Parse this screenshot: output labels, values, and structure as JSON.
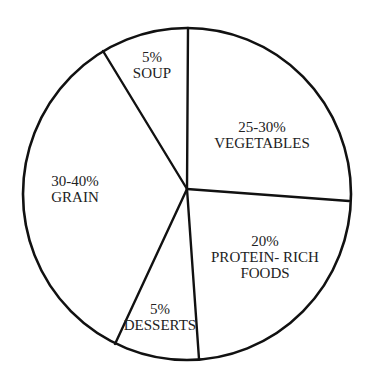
{
  "chart_data": {
    "type": "pie",
    "title": "",
    "style": {
      "stroke_color": "#111111",
      "fill_color": "#ffffff",
      "text_color": "#222222"
    },
    "geometry": {
      "hub": [
        187,
        189
      ],
      "ellipse": {
        "cx": 187,
        "cy": 194,
        "rx": 164,
        "ry": 166
      },
      "spoke_endpoints": {
        "soup_vegetables": [
          188,
          28
        ],
        "vegetables_protein": [
          349,
          201
        ],
        "protein_desserts": [
          199,
          359
        ],
        "desserts_grain": [
          115,
          344
        ],
        "grain_soup": [
          103,
          51
        ]
      }
    },
    "slices": [
      {
        "key": "soup",
        "percent_label": "5%",
        "name": "SOUP",
        "value_min": 5,
        "value_max": 5,
        "label_lines": [
          "5%",
          "SOUP"
        ],
        "label_pos": [
          152,
          62
        ]
      },
      {
        "key": "vegetables",
        "percent_label": "25-30%",
        "name": "VEGETABLES",
        "value_min": 25,
        "value_max": 30,
        "label_lines": [
          "25-30%",
          "VEGETABLES"
        ],
        "label_pos": [
          262,
          132
        ]
      },
      {
        "key": "protein",
        "percent_label": "20%",
        "name": "PROTEIN- RICH FOODS",
        "value_min": 20,
        "value_max": 20,
        "label_lines": [
          "20%",
          "PROTEIN- RICH",
          "FOODS"
        ],
        "label_pos": [
          265,
          246
        ]
      },
      {
        "key": "desserts",
        "percent_label": "5%",
        "name": "DESSERTS",
        "value_min": 5,
        "value_max": 5,
        "label_lines": [
          "5%",
          "DESSERTS"
        ],
        "label_pos": [
          160,
          314
        ]
      },
      {
        "key": "grain",
        "percent_label": "30-40%",
        "name": "GRAIN",
        "value_min": 30,
        "value_max": 40,
        "label_lines": [
          "30-40%",
          "GRAIN"
        ],
        "label_pos": [
          75,
          186
        ]
      }
    ],
    "categories": [
      "SOUP",
      "VEGETABLES",
      "PROTEIN- RICH FOODS",
      "DESSERTS",
      "GRAIN"
    ],
    "values": [
      5,
      27.5,
      20,
      5,
      35
    ],
    "value_labels": [
      "5%",
      "25-30%",
      "20%",
      "5%",
      "30-40%"
    ],
    "legend": "none (labels inside slices)"
  }
}
